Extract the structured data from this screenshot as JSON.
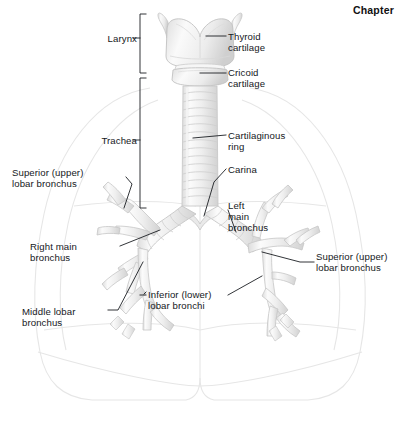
{
  "page": {
    "header_label": "Chapter",
    "figure_title": "Larynx, trachea and bronchial tree",
    "width": 400,
    "height": 425
  },
  "colors": {
    "background": "#ffffff",
    "text": "#15181c",
    "leader_line": "#1b1e22",
    "cartilage_fill": "#f2f2f2",
    "cartilage_shade": "#e2e2e2",
    "cartilage_outline": "#c9c9c9",
    "lung_outline": "#e6e6e6"
  },
  "brackets": [
    {
      "name": "larynx",
      "label": "Larynx",
      "top": 14,
      "bottom": 73
    },
    {
      "name": "trachea",
      "label": "Trachea",
      "top": 78,
      "bottom": 208
    }
  ],
  "labels": [
    {
      "name": "larynx",
      "text": "Larynx",
      "align": "right",
      "x": 104,
      "y": 33
    },
    {
      "name": "thyroid-cartilage",
      "text": "Thyroid\ncartilage",
      "align": "left",
      "x": 228,
      "y": 31
    },
    {
      "name": "cricoid-cartilage",
      "text": "Cricoid\ncartilage",
      "align": "left",
      "x": 228,
      "y": 67
    },
    {
      "name": "trachea",
      "text": "Trachea",
      "align": "right",
      "x": 104,
      "y": 135
    },
    {
      "name": "cartilaginous-ring",
      "text": "Cartilaginous\nring",
      "align": "left",
      "x": 228,
      "y": 130
    },
    {
      "name": "carina",
      "text": "Carina",
      "align": "left",
      "x": 228,
      "y": 164
    },
    {
      "name": "superior-lobar-bronchus-left-page",
      "text": "Superior (upper)\nlobar bronchus",
      "align": "left",
      "x": 12,
      "y": 167
    },
    {
      "name": "left-main-bronchus",
      "text": "Left\nmain\nbronchus",
      "align": "left",
      "x": 228,
      "y": 200
    },
    {
      "name": "right-main-bronchus",
      "text": "Right main\nbronchus",
      "align": "left",
      "x": 30,
      "y": 241
    },
    {
      "name": "superior-lobar-bronchus-right-page",
      "text": "Superior (upper)\nlobar bronchus",
      "align": "left",
      "x": 316,
      "y": 251
    },
    {
      "name": "inferior-lobar-bronchi",
      "text": "Inferior (lower)\nlobar bronchi",
      "align": "left",
      "x": 148,
      "y": 289
    },
    {
      "name": "middle-lobar-bronchus",
      "text": "Middle lobar\nbronchus",
      "align": "left",
      "x": 22,
      "y": 306
    }
  ],
  "structures": [
    {
      "name": "thyroid-cartilage",
      "description": "shield-shaped laryngeal cartilage with superior horns and median notch"
    },
    {
      "name": "cricoid-cartilage",
      "description": "ring cartilage below thyroid cartilage"
    },
    {
      "name": "trachea",
      "description": "windpipe formed of stacked C-shaped cartilaginous rings",
      "ring_count": 14
    },
    {
      "name": "carina",
      "description": "ridge at tracheal bifurcation"
    },
    {
      "name": "right-main-bronchus",
      "description": "primary bronchus to right lung"
    },
    {
      "name": "left-main-bronchus",
      "description": "primary bronchus to left lung"
    },
    {
      "name": "right-superior-lobar-bronchus",
      "description": "upper lobe branch, right"
    },
    {
      "name": "right-middle-lobar-bronchus",
      "description": "middle lobe branch, right"
    },
    {
      "name": "right-inferior-lobar-bronchi",
      "description": "lower lobe branches, right"
    },
    {
      "name": "left-superior-lobar-bronchus",
      "description": "upper lobe branch, left"
    },
    {
      "name": "left-inferior-lobar-bronchi",
      "description": "lower lobe branches, left"
    },
    {
      "name": "lung-outline",
      "description": "faint outline of both lungs, thorax and diaphragm"
    }
  ]
}
